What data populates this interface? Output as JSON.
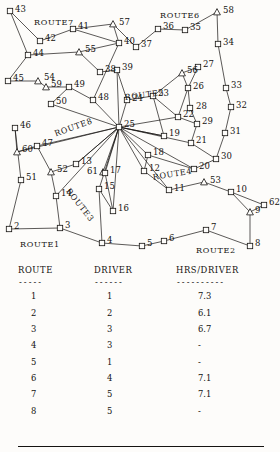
{
  "map": {
    "route_labels": [
      {
        "text": "ROUTE",
        "num": "7",
        "x": 34,
        "y": 17,
        "rot": 0
      },
      {
        "text": "ROUTE",
        "num": "6",
        "x": 160,
        "y": 10,
        "rot": 0
      },
      {
        "text": "ROUTE",
        "num": "5",
        "x": 124,
        "y": 92,
        "rot": -7
      },
      {
        "text": "ROUTE",
        "num": "8",
        "x": 53,
        "y": 129,
        "rot": -20
      },
      {
        "text": "ROUTE",
        "num": "4",
        "x": 152,
        "y": 172,
        "rot": -9
      },
      {
        "text": "ROUTE",
        "num": "3",
        "x": 72,
        "y": 186,
        "rot": 52
      },
      {
        "text": "ROUTE",
        "num": "1",
        "x": 20,
        "y": 239,
        "rot": 0
      },
      {
        "text": "ROUTE",
        "num": "2",
        "x": 196,
        "y": 245,
        "rot": 0
      }
    ],
    "nodes": [
      {
        "id": "43",
        "x": 10,
        "y": 11,
        "shape": "square",
        "lx": 15,
        "ly": 10
      },
      {
        "id": "42",
        "x": 40,
        "y": 41,
        "shape": "square",
        "lx": 45,
        "ly": 39
      },
      {
        "id": "41",
        "x": 73,
        "y": 29,
        "shape": "square",
        "lx": 78,
        "ly": 27
      },
      {
        "id": "57",
        "x": 113,
        "y": 24,
        "shape": "triangle",
        "lx": 119,
        "ly": 23
      },
      {
        "id": "36",
        "x": 158,
        "y": 29,
        "shape": "square",
        "lx": 163,
        "ly": 27
      },
      {
        "id": "35",
        "x": 185,
        "y": 30,
        "shape": "square",
        "lx": 190,
        "ly": 28
      },
      {
        "id": "58",
        "x": 217,
        "y": 12,
        "shape": "triangle",
        "lx": 223,
        "ly": 11
      },
      {
        "id": "44",
        "x": 28,
        "y": 55,
        "shape": "square",
        "lx": 33,
        "ly": 54
      },
      {
        "id": "55",
        "x": 79,
        "y": 52,
        "shape": "triangle",
        "lx": 85,
        "ly": 50
      },
      {
        "id": "40",
        "x": 119,
        "y": 43,
        "shape": "square",
        "lx": 124,
        "ly": 42
      },
      {
        "id": "37",
        "x": 136,
        "y": 47,
        "shape": "square",
        "lx": 141,
        "ly": 45
      },
      {
        "id": "34",
        "x": 218,
        "y": 44,
        "shape": "square",
        "lx": 223,
        "ly": 43
      },
      {
        "id": "45",
        "x": 8,
        "y": 81,
        "shape": "square",
        "lx": 13,
        "ly": 79
      },
      {
        "id": "54",
        "x": 38,
        "y": 81,
        "shape": "triangle",
        "lx": 44,
        "ly": 78
      },
      {
        "id": "59",
        "x": 46,
        "y": 87,
        "shape": "triangle",
        "lx": 51,
        "ly": 85
      },
      {
        "id": "49",
        "x": 69,
        "y": 87,
        "shape": "square",
        "lx": 74,
        "ly": 85
      },
      {
        "id": "38",
        "x": 100,
        "y": 72,
        "shape": "square",
        "lx": 105,
        "ly": 70
      },
      {
        "id": "39",
        "x": 117,
        "y": 70,
        "shape": "square",
        "lx": 122,
        "ly": 68
      },
      {
        "id": "56",
        "x": 182,
        "y": 73,
        "shape": "triangle",
        "lx": 187,
        "ly": 71
      },
      {
        "id": "27",
        "x": 198,
        "y": 67,
        "shape": "square",
        "lx": 203,
        "ly": 65
      },
      {
        "id": "33",
        "x": 226,
        "y": 88,
        "shape": "square",
        "lx": 231,
        "ly": 86
      },
      {
        "id": "50",
        "x": 51,
        "y": 104,
        "shape": "square",
        "lx": 56,
        "ly": 102
      },
      {
        "id": "48",
        "x": 93,
        "y": 100,
        "shape": "square",
        "lx": 98,
        "ly": 98
      },
      {
        "id": "24",
        "x": 127,
        "y": 100,
        "shape": "square",
        "lx": 132,
        "ly": 99
      },
      {
        "id": "23",
        "x": 153,
        "y": 96,
        "shape": "square",
        "lx": 158,
        "ly": 94
      },
      {
        "id": "26",
        "x": 188,
        "y": 88,
        "shape": "square",
        "lx": 193,
        "ly": 87
      },
      {
        "id": "28",
        "x": 190,
        "y": 108,
        "shape": "square",
        "lx": 196,
        "ly": 107
      },
      {
        "id": "32",
        "x": 231,
        "y": 107,
        "shape": "square",
        "lx": 236,
        "ly": 106
      },
      {
        "id": "46",
        "x": 15,
        "y": 128,
        "shape": "square",
        "lx": 20,
        "ly": 126
      },
      {
        "id": "60",
        "x": 17,
        "y": 152,
        "shape": "triangle",
        "lx": 22,
        "ly": 150
      },
      {
        "id": "47",
        "x": 37,
        "y": 146,
        "shape": "square",
        "lx": 42,
        "ly": 144
      },
      {
        "id": "25",
        "x": 119,
        "y": 127,
        "shape": "square",
        "lx": 124,
        "ly": 125
      },
      {
        "id": "22",
        "x": 178,
        "y": 117,
        "shape": "square",
        "lx": 183,
        "ly": 115
      },
      {
        "id": "29",
        "x": 197,
        "y": 124,
        "shape": "square",
        "lx": 202,
        "ly": 122
      },
      {
        "id": "31",
        "x": 225,
        "y": 133,
        "shape": "square",
        "lx": 230,
        "ly": 132
      },
      {
        "id": "19",
        "x": 164,
        "y": 136,
        "shape": "square",
        "lx": 169,
        "ly": 134
      },
      {
        "id": "21",
        "x": 191,
        "y": 143,
        "shape": "square",
        "lx": 196,
        "ly": 141
      },
      {
        "id": "30",
        "x": 216,
        "y": 159,
        "shape": "square",
        "lx": 221,
        "ly": 157
      },
      {
        "id": "18",
        "x": 148,
        "y": 155,
        "shape": "square",
        "lx": 153,
        "ly": 153
      },
      {
        "id": "20",
        "x": 194,
        "y": 169,
        "shape": "square",
        "lx": 199,
        "ly": 167
      },
      {
        "id": "51",
        "x": 21,
        "y": 180,
        "shape": "square",
        "lx": 26,
        "ly": 178
      },
      {
        "id": "52",
        "x": 51,
        "y": 172,
        "shape": "triangle",
        "lx": 57,
        "ly": 170
      },
      {
        "id": "13",
        "x": 76,
        "y": 164,
        "shape": "square",
        "lx": 81,
        "ly": 162
      },
      {
        "id": "61",
        "x": 103,
        "y": 172,
        "shape": "triangle",
        "lx": 87,
        "ly": 172
      },
      {
        "id": "15",
        "x": 99,
        "y": 189,
        "shape": "square",
        "lx": 104,
        "ly": 187
      },
      {
        "id": "17",
        "x": 105,
        "y": 173,
        "shape": "square",
        "lx": 110,
        "ly": 171
      },
      {
        "id": "12",
        "x": 144,
        "y": 171,
        "shape": "square",
        "lx": 149,
        "ly": 169
      },
      {
        "id": "14",
        "x": 56,
        "y": 196,
        "shape": "square",
        "lx": 61,
        "ly": 194
      },
      {
        "id": "16",
        "x": 113,
        "y": 211,
        "shape": "square",
        "lx": 118,
        "ly": 209
      },
      {
        "id": "11",
        "x": 169,
        "y": 190,
        "shape": "square",
        "lx": 174,
        "ly": 189
      },
      {
        "id": "53",
        "x": 204,
        "y": 182,
        "shape": "triangle",
        "lx": 210,
        "ly": 181
      },
      {
        "id": "10",
        "x": 231,
        "y": 192,
        "shape": "square",
        "lx": 236,
        "ly": 190
      },
      {
        "id": "62",
        "x": 264,
        "y": 205,
        "shape": "square",
        "lx": 269,
        "ly": 203
      },
      {
        "id": "9",
        "x": 250,
        "y": 212,
        "shape": "triangle",
        "lx": 255,
        "ly": 211
      },
      {
        "id": "2",
        "x": 9,
        "y": 229,
        "shape": "square",
        "lx": 14,
        "ly": 227
      },
      {
        "id": "3",
        "x": 60,
        "y": 228,
        "shape": "square",
        "lx": 65,
        "ly": 226
      },
      {
        "id": "4",
        "x": 102,
        "y": 243,
        "shape": "square",
        "lx": 107,
        "ly": 241
      },
      {
        "id": "5",
        "x": 142,
        "y": 246,
        "shape": "square",
        "lx": 147,
        "ly": 244
      },
      {
        "id": "6",
        "x": 164,
        "y": 241,
        "shape": "square",
        "lx": 169,
        "ly": 239
      },
      {
        "id": "7",
        "x": 206,
        "y": 230,
        "shape": "square",
        "lx": 211,
        "ly": 228
      },
      {
        "id": "8",
        "x": 250,
        "y": 246,
        "shape": "square",
        "lx": 255,
        "ly": 244
      }
    ],
    "edges": [
      [
        "43",
        "42"
      ],
      [
        "42",
        "41"
      ],
      [
        "41",
        "57"
      ],
      [
        "43",
        "44"
      ],
      [
        "44",
        "45"
      ],
      [
        "44",
        "55"
      ],
      [
        "55",
        "40"
      ],
      [
        "57",
        "40"
      ],
      [
        "57",
        "37"
      ],
      [
        "37",
        "36"
      ],
      [
        "36",
        "35"
      ],
      [
        "35",
        "58"
      ],
      [
        "58",
        "34"
      ],
      [
        "34",
        "33"
      ],
      [
        "33",
        "32"
      ],
      [
        "32",
        "31"
      ],
      [
        "31",
        "30"
      ],
      [
        "55",
        "38"
      ],
      [
        "38",
        "39"
      ],
      [
        "39",
        "24"
      ],
      [
        "40",
        "48"
      ],
      [
        "41",
        "40"
      ],
      [
        "45",
        "54"
      ],
      [
        "54",
        "59"
      ],
      [
        "59",
        "49"
      ],
      [
        "49",
        "50"
      ],
      [
        "49",
        "48"
      ],
      [
        "50",
        "25"
      ],
      [
        "48",
        "25"
      ],
      [
        "24",
        "25"
      ],
      [
        "24",
        "23"
      ],
      [
        "23",
        "22"
      ],
      [
        "56",
        "27"
      ],
      [
        "27",
        "26"
      ],
      [
        "26",
        "28"
      ],
      [
        "56",
        "26"
      ],
      [
        "28",
        "29"
      ],
      [
        "29",
        "21"
      ],
      [
        "22",
        "29"
      ],
      [
        "21",
        "30"
      ],
      [
        "23",
        "19"
      ],
      [
        "19",
        "25"
      ],
      [
        "25",
        "18"
      ],
      [
        "18",
        "20"
      ],
      [
        "20",
        "30"
      ],
      [
        "25",
        "22"
      ],
      [
        "25",
        "19"
      ],
      [
        "25",
        "20"
      ],
      [
        "25",
        "21"
      ],
      [
        "46",
        "60"
      ],
      [
        "60",
        "47"
      ],
      [
        "47",
        "52"
      ],
      [
        "46",
        "51"
      ],
      [
        "51",
        "2"
      ],
      [
        "52",
        "13"
      ],
      [
        "13",
        "25"
      ],
      [
        "25",
        "13"
      ],
      [
        "60",
        "25"
      ],
      [
        "47",
        "25"
      ],
      [
        "25",
        "61"
      ],
      [
        "25",
        "15"
      ],
      [
        "25",
        "17"
      ],
      [
        "25",
        "12"
      ],
      [
        "25",
        "16"
      ],
      [
        "25",
        "14"
      ],
      [
        "52",
        "14"
      ],
      [
        "14",
        "3"
      ],
      [
        "2",
        "3"
      ],
      [
        "15",
        "16"
      ],
      [
        "17",
        "16"
      ],
      [
        "12",
        "11"
      ],
      [
        "11",
        "53"
      ],
      [
        "53",
        "10"
      ],
      [
        "10",
        "62"
      ],
      [
        "62",
        "9"
      ],
      [
        "9",
        "8"
      ],
      [
        "8",
        "7"
      ],
      [
        "7",
        "6"
      ],
      [
        "6",
        "5"
      ],
      [
        "5",
        "4"
      ],
      [
        "4",
        "3"
      ],
      [
        "18",
        "12"
      ],
      [
        "15",
        "4"
      ],
      [
        "25",
        "11"
      ],
      [
        "39",
        "25"
      ],
      [
        "56",
        "23"
      ],
      [
        "26",
        "22"
      ],
      [
        "10",
        "9"
      ]
    ]
  },
  "table": {
    "headers": [
      "ROUTE",
      "DRIVER",
      "HRS/DRIVER"
    ],
    "header_rules": [
      "-----",
      "------",
      "----------"
    ],
    "rows": [
      {
        "route": "1",
        "driver": "1",
        "hrs": "7.3"
      },
      {
        "route": "2",
        "driver": "2",
        "hrs": "6.1"
      },
      {
        "route": "3",
        "driver": "3",
        "hrs": "6.7"
      },
      {
        "route": "4",
        "driver": "3",
        "hrs": "-"
      },
      {
        "route": "5",
        "driver": "1",
        "hrs": "-"
      },
      {
        "route": "6",
        "driver": "4",
        "hrs": "7.1"
      },
      {
        "route": "7",
        "driver": "5",
        "hrs": "7.1"
      },
      {
        "route": "8",
        "driver": "5",
        "hrs": "-"
      }
    ]
  },
  "colors": {
    "ink": "#151311",
    "paper": "#fdfcfa"
  }
}
